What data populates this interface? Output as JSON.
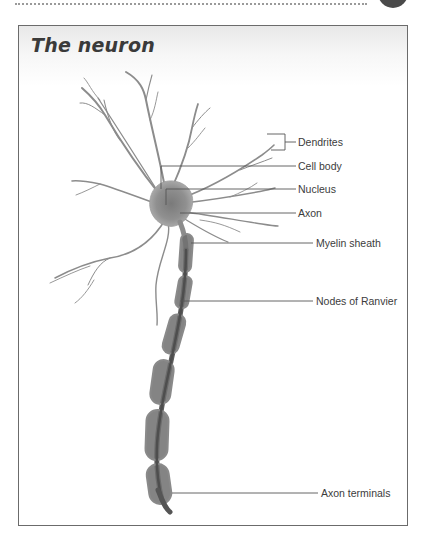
{
  "page": {
    "badge_color": "#4a4a4a",
    "rule_color": "#9a9a9a"
  },
  "figure": {
    "title": "The neuron",
    "frame_border_color": "#6b6b6b",
    "neuron_fill_color": "#8a8a8a",
    "myelin_color": "#6e6e6e",
    "labels": [
      {
        "id": "dendrites",
        "text": "Dendrites",
        "x": 298,
        "y": 163
      },
      {
        "id": "cell-body",
        "text": "Cell body",
        "x": 298,
        "y": 187
      },
      {
        "id": "nucleus",
        "text": "Nucleus",
        "x": 298,
        "y": 210
      },
      {
        "id": "axon",
        "text": "Axon",
        "x": 298,
        "y": 232
      },
      {
        "id": "myelin-sheath",
        "text": "Myelin sheath",
        "x": 315,
        "y": 264
      },
      {
        "id": "nodes-of-ranvier",
        "text": "Nodes of Ranvier",
        "x": 315,
        "y": 295
      },
      {
        "id": "axon-terminals",
        "text": "Axon terminals",
        "x": 321,
        "y": 486
      }
    ]
  }
}
